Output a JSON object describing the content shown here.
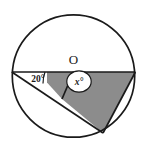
{
  "figure": {
    "type": "circle-geometry-diagram",
    "background_color": "#ffffff",
    "stroke_color": "#1a1a1a",
    "shade_color": "#8c8c8c",
    "arc_fill_color": "#f2f2f2",
    "labels": {
      "center": "O",
      "angle_left": "20°",
      "angle_center": "x°"
    },
    "circle": {
      "cx": 73.5,
      "cy": 76.0,
      "r": 62.0,
      "stroke_width": 1.6
    },
    "points": {
      "left_vertex": {
        "x": 11.8,
        "y": 72.0
      },
      "right_vertex": {
        "x": 135.4,
        "y": 72.0
      },
      "center": {
        "x": 73.5,
        "y": 72.0
      },
      "intersection": {
        "x": 62.0,
        "y": 99.0
      },
      "bottom_vertex": {
        "x": 103.0,
        "y": 133.0
      }
    },
    "segments": [
      {
        "name": "horizontal-diameter",
        "from": "left_vertex",
        "to": "right_vertex"
      },
      {
        "name": "chord-left-to-bottom",
        "from": "left_vertex",
        "to": "bottom_vertex"
      },
      {
        "name": "radius-center-to-intersection",
        "from": "center",
        "to": "intersection"
      },
      {
        "name": "segment-bottom-to-right",
        "from": "bottom_vertex",
        "to": "right_vertex"
      }
    ],
    "shaded_region": {
      "name": "shaded-quadrilateral",
      "vertices": [
        "center",
        "intersection",
        "bottom_vertex",
        "right_vertex"
      ]
    },
    "angle_markers": [
      {
        "name": "angle-20-arc",
        "at": "left_vertex",
        "value": "20°"
      },
      {
        "name": "angle-x-arc",
        "at": "center",
        "value": "x°"
      }
    ]
  }
}
